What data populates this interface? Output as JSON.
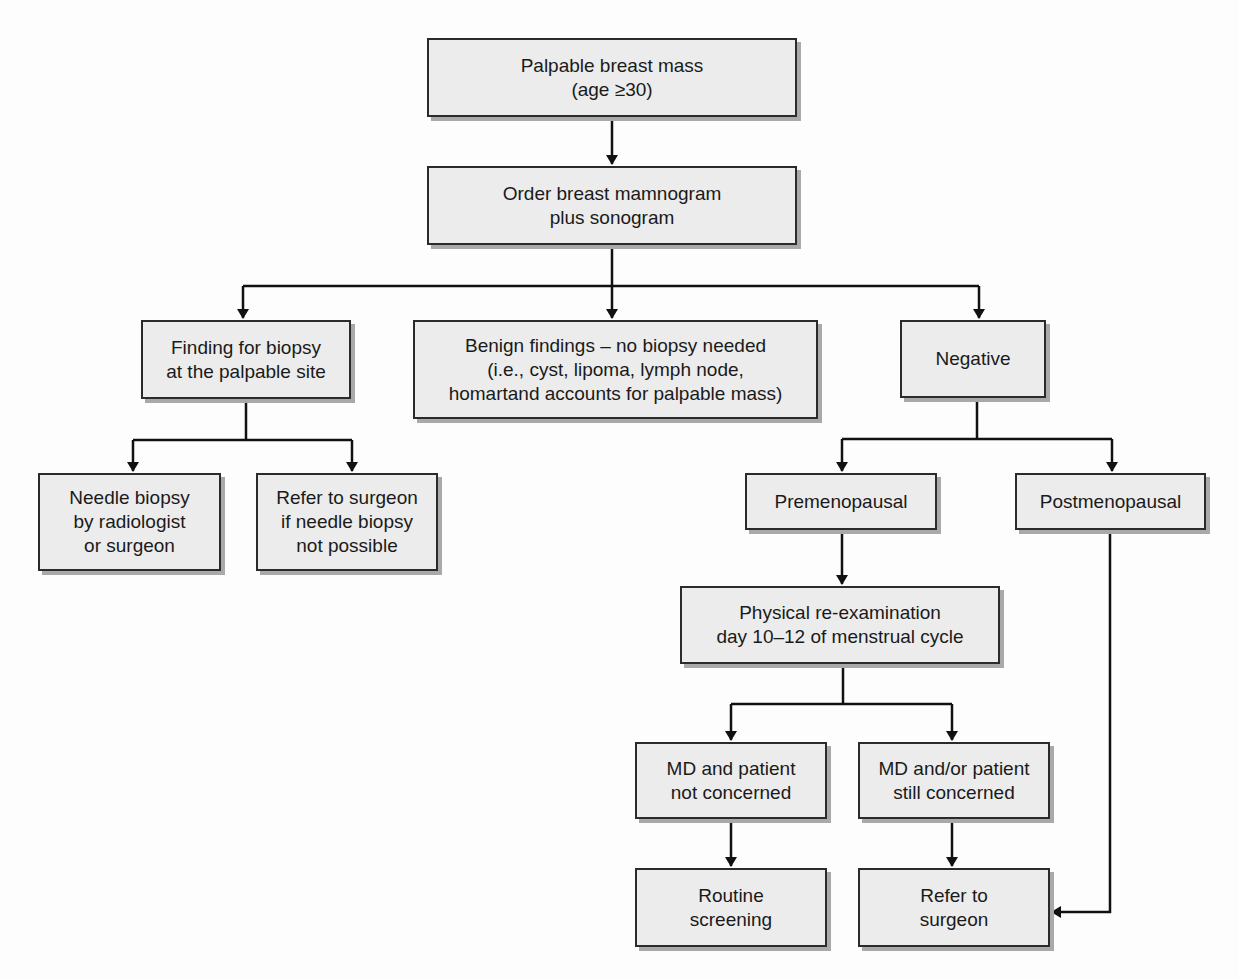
{
  "diagram": {
    "type": "flowchart",
    "colors": {
      "background": "#fdfdfd",
      "box_fill": "#ececec",
      "box_border": "#2b2b2b",
      "box_shadow": "#a9a9a9",
      "line": "#111111"
    },
    "nodes": {
      "start": {
        "lines": [
          "Palpable breast mass",
          "(age ≥30)"
        ]
      },
      "order_imaging": {
        "lines": [
          "Order breast mamnogram",
          "plus sonogram"
        ]
      },
      "finding_biopsy": {
        "lines": [
          "Finding for biopsy",
          "at the palpable site"
        ]
      },
      "benign": {
        "lines": [
          "Benign findings – no biopsy needed",
          "(i.e., cyst, lipoma, lymph node,",
          "homartand accounts for palpable mass)"
        ]
      },
      "negative": {
        "lines": [
          "Negative"
        ]
      },
      "needle_biopsy": {
        "lines": [
          "Needle biopsy",
          "by radiologist",
          "or surgeon"
        ]
      },
      "refer_if_needle": {
        "lines": [
          "Refer to surgeon",
          "if needle biopsy",
          "not possible"
        ]
      },
      "premenopausal": {
        "lines": [
          "Premenopausal"
        ]
      },
      "postmenopausal": {
        "lines": [
          "Postmenopausal"
        ]
      },
      "reexam": {
        "lines": [
          "Physical re-examination",
          "day 10–12 of menstrual cycle"
        ]
      },
      "not_concerned": {
        "lines": [
          "MD and patient",
          "not concerned"
        ]
      },
      "still_concerned": {
        "lines": [
          "MD and/or patient",
          "still concerned"
        ]
      },
      "routine": {
        "lines": [
          "Routine",
          "screening"
        ]
      },
      "refer_surgeon": {
        "lines": [
          "Refer to",
          "surgeon"
        ]
      }
    },
    "edges": [
      {
        "from": "start",
        "to": "order_imaging"
      },
      {
        "from": "order_imaging",
        "to": "finding_biopsy"
      },
      {
        "from": "order_imaging",
        "to": "benign"
      },
      {
        "from": "order_imaging",
        "to": "negative"
      },
      {
        "from": "finding_biopsy",
        "to": "needle_biopsy"
      },
      {
        "from": "finding_biopsy",
        "to": "refer_if_needle"
      },
      {
        "from": "negative",
        "to": "premenopausal"
      },
      {
        "from": "negative",
        "to": "postmenopausal"
      },
      {
        "from": "premenopausal",
        "to": "reexam"
      },
      {
        "from": "reexam",
        "to": "not_concerned"
      },
      {
        "from": "reexam",
        "to": "still_concerned"
      },
      {
        "from": "not_concerned",
        "to": "routine"
      },
      {
        "from": "still_concerned",
        "to": "refer_surgeon"
      },
      {
        "from": "postmenopausal",
        "to": "refer_surgeon"
      }
    ]
  }
}
